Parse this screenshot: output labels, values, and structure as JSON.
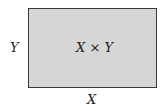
{
  "diagram": {
    "type": "rectangle-area",
    "area_label": "X × Y",
    "width_label": "X",
    "height_label": "Y",
    "colors": {
      "fill": "#d6d6d6",
      "border": "#3a3a3a",
      "text": "#222222"
    }
  }
}
